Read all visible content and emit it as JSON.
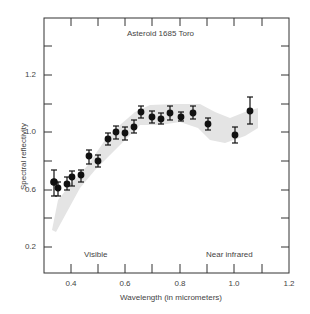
{
  "chart_data": {
    "type": "scatter",
    "title": "Asteroid 1685 Toro",
    "xlabel": "Wavelength (in micrometers)",
    "ylabel": "Spectral reflectivity",
    "xlim": [
      0.3,
      1.2
    ],
    "x_ticks": [
      "0.4",
      "0.6",
      "0.8",
      "1.0",
      "1.2"
    ],
    "y_ticks": [
      "1.2",
      "1.0",
      "0.6",
      "0.2"
    ],
    "grid": false,
    "annotations": [
      "Visible",
      "Near infrared"
    ],
    "series": [
      {
        "name": "Toro reflectance (with error bars)",
        "x": [
          0.335,
          0.35,
          0.385,
          0.4,
          0.435,
          0.465,
          0.5,
          0.535,
          0.565,
          0.6,
          0.635,
          0.665,
          0.7,
          0.735,
          0.77,
          0.8,
          0.845,
          0.9,
          1.0,
          1.055
        ],
        "y": [
          0.66,
          0.61,
          0.63,
          0.69,
          0.7,
          0.83,
          0.8,
          0.95,
          1.0,
          0.99,
          1.02,
          1.07,
          1.05,
          1.05,
          1.07,
          1.05,
          1.07,
          1.03,
          0.98,
          1.07
        ]
      },
      {
        "name": "Comparison band (shaded)",
        "type": "area"
      }
    ]
  },
  "labels": {
    "title": "Asteroid 1685 Toro",
    "xlabel": "Wavelength (in micrometers)",
    "ylabel": "Spectral reflectivity",
    "visible": "Visible",
    "near_ir": "Near infrared",
    "x0": "0.4",
    "x1": "0.6",
    "x2": "0.8",
    "x3": "1.0",
    "x4": "1.2",
    "y0": "1.2",
    "y1": "1.0",
    "y2": "0.6",
    "y3": "0.2"
  },
  "points_px": [
    [
      54,
      182,
      170,
      196,
      3.2
    ],
    [
      58,
      188,
      182,
      196,
      2.8
    ],
    [
      67,
      184,
      177,
      190,
      2.8
    ],
    [
      72,
      177,
      171,
      186,
      2.8
    ],
    [
      81,
      175,
      170,
      182,
      2.8
    ],
    [
      89,
      156,
      150,
      164,
      2.8
    ],
    [
      98,
      161,
      155,
      167,
      2.8
    ],
    [
      108,
      139,
      133,
      145,
      2.8
    ],
    [
      116,
      132,
      126,
      139,
      2.8
    ],
    [
      125,
      133,
      127,
      140,
      2.8
    ],
    [
      134,
      127,
      120,
      133,
      2.8
    ],
    [
      141,
      112,
      106,
      118,
      2.8
    ],
    [
      152,
      117,
      111,
      123,
      2.8
    ],
    [
      161,
      119,
      113,
      124,
      2.8
    ],
    [
      170,
      113,
      106,
      120,
      2.8
    ],
    [
      181,
      117,
      112,
      121,
      2.8
    ],
    [
      193,
      113,
      106,
      119,
      2.8
    ],
    [
      208,
      124,
      118,
      130,
      2.8
    ],
    [
      235,
      135,
      127,
      143,
      2.8
    ],
    [
      250,
      111,
      97,
      124,
      2.8
    ]
  ]
}
